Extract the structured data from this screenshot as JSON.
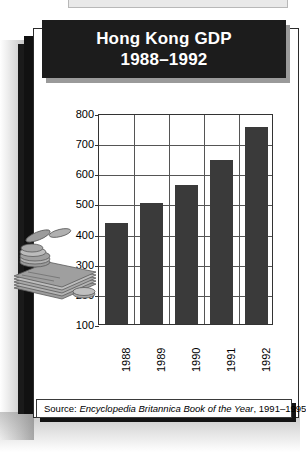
{
  "figure": {
    "title_line1": "Hong Kong GDP",
    "title_line2": "1988–1992",
    "source_prefix": "Source: ",
    "source_italic": "Encyclopedia Britannica Book of the Year",
    "source_suffix": ", 1991–1995",
    "illustration": "coins-and-banknotes-illustration"
  },
  "colors": {
    "bar_fill": "#3a3a3a",
    "title_background": "#1c1c1c",
    "title_text": "#ffffff",
    "panel_border": "#2b2b2b",
    "grid": "#555555"
  },
  "chart_data": {
    "type": "bar",
    "title": "Hong Kong GDP 1988–1992",
    "xlabel": "",
    "ylabel": "Billions of Hong Kong dollars",
    "categories": [
      "1988",
      "1989",
      "1990",
      "1991",
      "1992"
    ],
    "values": [
      435,
      500,
      560,
      645,
      755
    ],
    "ylim": [
      100,
      800
    ],
    "yticks": [
      100,
      200,
      300,
      400,
      500,
      600,
      700,
      800
    ],
    "ytick_labels": [
      "100",
      "200",
      "300",
      "400",
      "500",
      "600",
      "700",
      "800"
    ],
    "grid": true,
    "legend": null,
    "source": "Encyclopedia Britannica Book of the Year, 1991–1995"
  }
}
